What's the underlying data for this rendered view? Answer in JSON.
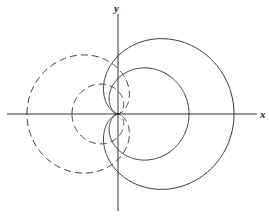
{
  "diagram": {
    "origin": [
      118,
      114
    ],
    "x_axis": {
      "from": 7,
      "to": 257,
      "label": "x"
    },
    "y_axis": {
      "from": 14,
      "to": 211,
      "label": "y"
    },
    "curves": [
      {
        "name": "outer-solid-cardioid",
        "a": 58,
        "direction": "right",
        "style": "solid"
      },
      {
        "name": "inner-solid-cardioid",
        "a": 35.5,
        "direction": "right",
        "style": "solid"
      },
      {
        "name": "outer-dashed-cardioid",
        "a": 45.5,
        "direction": "left",
        "style": "dashed"
      },
      {
        "name": "inner-dashed-cardioid",
        "a": 23,
        "direction": "left",
        "style": "dashed"
      }
    ]
  }
}
